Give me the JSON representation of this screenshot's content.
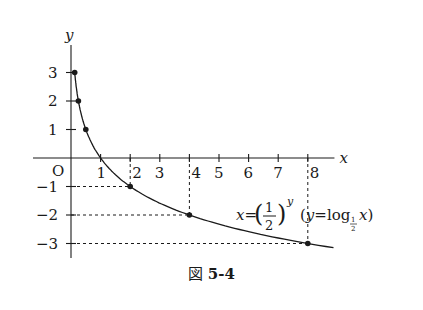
{
  "chart_data": {
    "type": "line",
    "title": "",
    "xlabel": "x",
    "ylabel": "y",
    "origin_label": "O",
    "x_ticks": [
      1,
      2,
      3,
      4,
      5,
      6,
      7,
      8
    ],
    "y_ticks": [
      3,
      2,
      1,
      -1,
      -2,
      -3
    ],
    "xlim": [
      -0.5,
      9.2
    ],
    "ylim": [
      -4,
      4.3
    ],
    "grid": false,
    "series": [
      {
        "name": "x=(1/2)^y (y=log_{1/2} x)",
        "function": "y = log_{1/2}(x)",
        "marked_points": [
          {
            "x": 0.125,
            "y": 3
          },
          {
            "x": 0.25,
            "y": 2
          },
          {
            "x": 0.5,
            "y": 1
          },
          {
            "x": 2,
            "y": -1
          },
          {
            "x": 4,
            "y": -2
          },
          {
            "x": 8,
            "y": -3
          }
        ]
      }
    ],
    "guide_lines": "dashed lines from marked points (2,-1), (4,-2), (8,-3) to both axes",
    "annotation": "x=(1/2)^y (y=log_{1/2} x)"
  },
  "labels": {
    "formula_lhs": "x=",
    "frac_num": "1",
    "frac_den": "2",
    "exp": "y",
    "paren_expr_open": "(y=log",
    "paren_expr_x": "x)",
    "caption_prefix": "図",
    "caption_number": "5-4"
  }
}
